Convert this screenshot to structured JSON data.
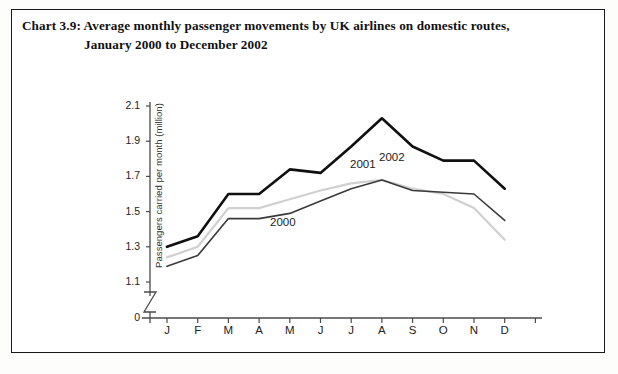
{
  "caption": {
    "number": "Chart 3.9:",
    "line1": "Chart 3.9:  Average monthly passenger movements by UK airlines on domestic routes,",
    "line2": "January 2000 to December 2002"
  },
  "chart_data": {
    "type": "line",
    "title": "Average monthly passenger movements by UK airlines on domestic routes, January 2000 to December 2002",
    "xlabel": "",
    "ylabel": "Passengers carried per month (million)",
    "categories": [
      "J",
      "F",
      "M",
      "A",
      "M",
      "J",
      "J",
      "A",
      "S",
      "O",
      "N",
      "D"
    ],
    "ylim": [
      1.1,
      2.1
    ],
    "yticks": [
      "0",
      "1.1",
      "1.3",
      "1.5",
      "1.7",
      "1.9",
      "2.1"
    ],
    "axis_break": true,
    "grid": false,
    "legend": "in-plot annotations",
    "series": [
      {
        "name": "2000",
        "color": "#3a3a3a",
        "width": 1.6,
        "label_x": 8,
        "values": [
          1.19,
          1.25,
          1.46,
          1.46,
          1.49,
          1.56,
          1.63,
          1.68,
          1.62,
          1.61,
          1.6,
          1.45
        ]
      },
      {
        "name": "2001",
        "color": "#d0d0d0",
        "width": 2.2,
        "label_x": 7,
        "values": [
          1.24,
          1.3,
          1.52,
          1.52,
          1.57,
          1.62,
          1.66,
          1.68,
          1.63,
          1.6,
          1.52,
          1.34
        ]
      },
      {
        "name": "2002",
        "color": "#101010",
        "width": 2.6,
        "label_x": 6,
        "values": [
          1.3,
          1.36,
          1.6,
          1.6,
          1.74,
          1.72,
          1.87,
          2.03,
          1.87,
          1.79,
          1.79,
          1.63
        ]
      }
    ],
    "annotations": [
      {
        "text": "2002",
        "x_px": 279,
        "y_px": 63
      },
      {
        "text": "2001",
        "x_px": 250,
        "y_px": 70
      },
      {
        "text": "2000",
        "x_px": 170,
        "y_px": 128
      }
    ]
  }
}
